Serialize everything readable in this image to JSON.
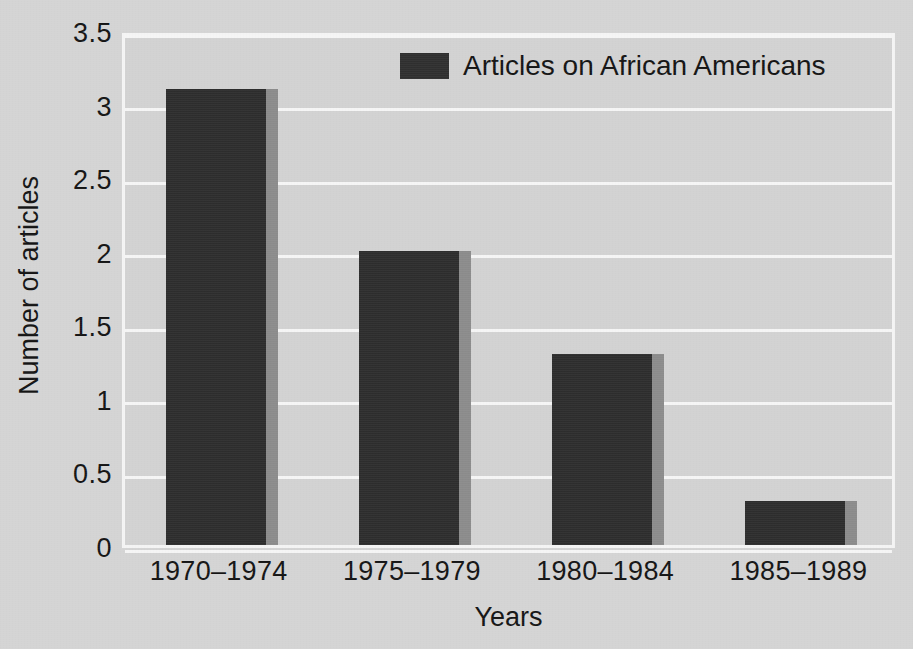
{
  "chart_data": {
    "type": "bar",
    "title": "",
    "categories": [
      "1970–1974",
      "1975–1979",
      "1980–1984",
      "1985–1989"
    ],
    "values": [
      3.1,
      2.0,
      1.3,
      0.3
    ],
    "series": [
      {
        "name": "Articles on African Americans",
        "values": [
          3.1,
          2.0,
          1.3,
          0.3
        ]
      }
    ],
    "xlabel": "Years",
    "ylabel": "Number of articles",
    "ylim": [
      0,
      3.5
    ],
    "yticks": [
      "0",
      "0.5",
      "1",
      "1.5",
      "2",
      "2.5",
      "3",
      "3.5"
    ],
    "ytick_values": [
      0,
      0.5,
      1,
      1.5,
      2,
      2.5,
      3,
      3.5
    ],
    "grid": true,
    "legend_position": "top-center",
    "legend": [
      "Articles on African Americans"
    ],
    "colors": {
      "bar": "#2d2d2d",
      "bar_shadow": "#8b8b8b",
      "plot_background": "#d2d2d2",
      "figure_background": "#d4d4d4",
      "gridline": "#f5f5f5",
      "text": "#141414"
    }
  },
  "legend": {
    "label": "Articles on African Americans",
    "swatch_color": "#2f2f2f"
  },
  "axes": {
    "y_title": "Number of articles",
    "x_title": "Years"
  }
}
